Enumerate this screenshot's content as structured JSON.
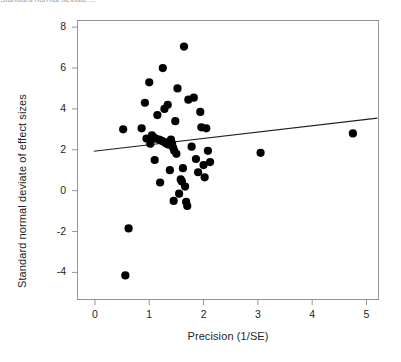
{
  "figure": {
    "top_caption": "Standard normal deviate ...",
    "background_color": "#ffffff",
    "frame_color": "#939598",
    "point_color": "#000000",
    "line_color": "#231f20"
  },
  "chart_data": {
    "type": "scatter",
    "title": "",
    "subtitle": "",
    "xlabel": "Precision (1/SE)",
    "ylabel": "Standard normal deviate of effect sizes",
    "xlim": [
      -0.33,
      5.23
    ],
    "ylim": [
      -5.35,
      8.35
    ],
    "xticks": [
      0,
      1,
      2,
      3,
      4,
      5
    ],
    "xticklabels": [
      "0",
      "1",
      "2",
      "3",
      "4",
      "5"
    ],
    "yticks": [
      -4,
      -2,
      0,
      2,
      4,
      6,
      8
    ],
    "yticklabels": [
      "-4",
      "-2",
      "0",
      "2",
      "4",
      "6",
      "8"
    ],
    "grid": false,
    "legend": null,
    "marker": "filled-circle",
    "marker_size_px": 5,
    "points": [
      {
        "x": 0.52,
        "y": 3.0
      },
      {
        "x": 0.56,
        "y": -4.15
      },
      {
        "x": 0.62,
        "y": -1.85
      },
      {
        "x": 0.86,
        "y": 3.05
      },
      {
        "x": 0.92,
        "y": 4.3
      },
      {
        "x": 0.95,
        "y": 2.55
      },
      {
        "x": 1.0,
        "y": 5.3
      },
      {
        "x": 1.02,
        "y": 2.3
      },
      {
        "x": 1.05,
        "y": 2.7
      },
      {
        "x": 1.08,
        "y": 2.6
      },
      {
        "x": 1.1,
        "y": 1.5
      },
      {
        "x": 1.12,
        "y": 2.55
      },
      {
        "x": 1.15,
        "y": 3.7
      },
      {
        "x": 1.18,
        "y": 2.5
      },
      {
        "x": 1.2,
        "y": 0.4
      },
      {
        "x": 1.22,
        "y": 2.45
      },
      {
        "x": 1.25,
        "y": 6.0
      },
      {
        "x": 1.26,
        "y": 2.4
      },
      {
        "x": 1.28,
        "y": 4.0
      },
      {
        "x": 1.3,
        "y": 2.35
      },
      {
        "x": 1.32,
        "y": 2.3
      },
      {
        "x": 1.34,
        "y": 4.2
      },
      {
        "x": 1.36,
        "y": 2.25
      },
      {
        "x": 1.38,
        "y": 1.0
      },
      {
        "x": 1.4,
        "y": 2.5
      },
      {
        "x": 1.42,
        "y": 2.3
      },
      {
        "x": 1.44,
        "y": 2.1
      },
      {
        "x": 1.45,
        "y": -0.5
      },
      {
        "x": 1.46,
        "y": 1.95
      },
      {
        "x": 1.48,
        "y": 3.4
      },
      {
        "x": 1.5,
        "y": 1.8
      },
      {
        "x": 1.52,
        "y": 5.0
      },
      {
        "x": 1.55,
        "y": -0.15
      },
      {
        "x": 1.58,
        "y": 0.55
      },
      {
        "x": 1.6,
        "y": 0.45
      },
      {
        "x": 1.62,
        "y": 1.1
      },
      {
        "x": 1.64,
        "y": 7.05
      },
      {
        "x": 1.66,
        "y": 0.2
      },
      {
        "x": 1.68,
        "y": -0.55
      },
      {
        "x": 1.7,
        "y": -0.75
      },
      {
        "x": 1.72,
        "y": 4.45
      },
      {
        "x": 1.78,
        "y": 2.15
      },
      {
        "x": 1.82,
        "y": 4.55
      },
      {
        "x": 1.86,
        "y": 1.55
      },
      {
        "x": 1.9,
        "y": 0.9
      },
      {
        "x": 1.94,
        "y": 3.85
      },
      {
        "x": 1.96,
        "y": 3.1
      },
      {
        "x": 2.0,
        "y": 1.25
      },
      {
        "x": 2.02,
        "y": 0.65
      },
      {
        "x": 2.05,
        "y": 3.05
      },
      {
        "x": 2.08,
        "y": 1.95
      },
      {
        "x": 2.12,
        "y": 1.4
      },
      {
        "x": 3.05,
        "y": 1.85
      },
      {
        "x": 4.75,
        "y": 2.8
      }
    ],
    "regression_line": {
      "label": "fitted regression line",
      "x_start": -0.02,
      "y_start": 1.93,
      "x_end": 5.2,
      "y_end": 3.55,
      "slope": 0.31,
      "intercept": 1.94
    }
  }
}
